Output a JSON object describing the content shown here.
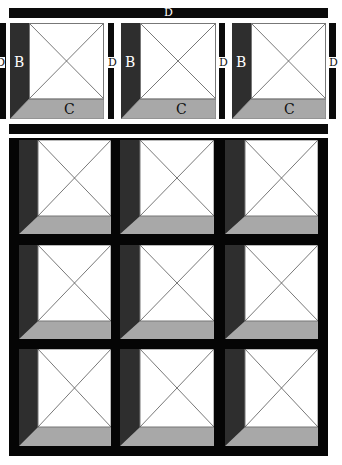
{
  "diagram": {
    "top_bar": {
      "label": "D"
    },
    "side_labels": [
      "D",
      "D",
      "D",
      "D"
    ],
    "top_row": {
      "tiles": [
        {
          "strip_label": "B",
          "floor_label": "C"
        },
        {
          "strip_label": "B",
          "floor_label": "C"
        },
        {
          "strip_label": "B",
          "floor_label": "C"
        }
      ]
    },
    "grid": {
      "rows": 3,
      "cols": 3
    },
    "colors": {
      "bar": "#0a0a0a",
      "strip": "#2e2e2e",
      "floor": "#a8a8a8",
      "face": "#ffffff",
      "line": "#555555"
    }
  }
}
